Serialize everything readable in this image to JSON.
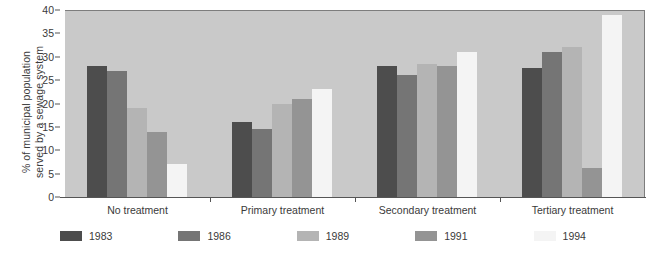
{
  "chart_data": {
    "type": "bar",
    "title": "",
    "subtitle": "",
    "xlabel": "",
    "ylabel": "% of municipal population served by a sewage system",
    "ylabel_line1": "% of municipal population",
    "ylabel_line2": "served by a sewage system",
    "ylim": [
      0,
      40
    ],
    "yticks": [
      0,
      5,
      10,
      15,
      20,
      25,
      30,
      35,
      40
    ],
    "ytick_labels": [
      "0",
      "5",
      "10",
      "15",
      "20",
      "25",
      "30",
      "35",
      "40"
    ],
    "grid": false,
    "legend_position": "bottom",
    "categories": [
      "No treatment",
      "Primary treatment",
      "Secondary treatment",
      "Tertiary treatment"
    ],
    "series": [
      {
        "name": "1983",
        "color": "#4d4d4d",
        "values": [
          28,
          16,
          28,
          27.5
        ]
      },
      {
        "name": "1986",
        "color": "#757575",
        "values": [
          27,
          14.5,
          26,
          31
        ]
      },
      {
        "name": "1989",
        "color": "#b4b4b4",
        "values": [
          19,
          20,
          28.5,
          32
        ]
      },
      {
        "name": "1991",
        "color": "#949494",
        "values": [
          14,
          21,
          28,
          6.3
        ]
      },
      {
        "name": "1994",
        "color": "#f4f4f4",
        "values": [
          7,
          23,
          31,
          39
        ]
      }
    ],
    "plot_background_color": "#c9c9c9",
    "figure_background_color": "#ffffff",
    "axis_color": "#555555"
  }
}
